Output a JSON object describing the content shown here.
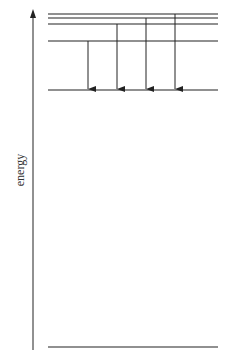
{
  "diagram": {
    "type": "energy-level-diagram",
    "axis": {
      "label": "energy",
      "x": 33,
      "y_top": 9,
      "y_bottom": 350,
      "direction": "up"
    },
    "levels": [
      {
        "name": "level-1",
        "y": 14
      },
      {
        "name": "level-2",
        "y": 18
      },
      {
        "name": "level-3",
        "y": 24
      },
      {
        "name": "level-4",
        "y": 41
      },
      {
        "name": "level-5",
        "y": 90
      },
      {
        "name": "ground",
        "y": 347
      }
    ],
    "level_x_start": 48,
    "level_x_end": 218,
    "transitions": [
      {
        "x": 88,
        "from_y": 41,
        "to_y": 90
      },
      {
        "x": 117,
        "from_y": 24,
        "to_y": 90
      },
      {
        "x": 146,
        "from_y": 18,
        "to_y": 90
      },
      {
        "x": 175,
        "from_y": 14,
        "to_y": 90
      }
    ],
    "color": "#222222"
  }
}
